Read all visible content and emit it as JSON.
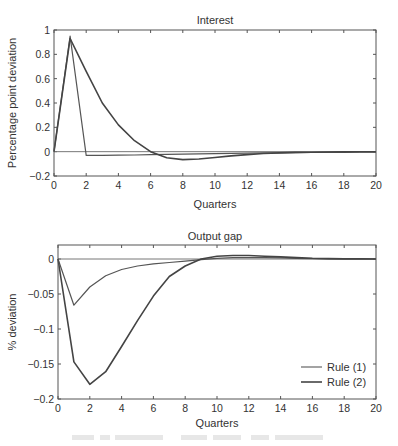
{
  "chart_data": [
    {
      "type": "line",
      "title": "Interest",
      "xlabel": "Quarters",
      "ylabel": "Percentage point deviation",
      "xlim": [
        0,
        20
      ],
      "ylim": [
        -0.2,
        1
      ],
      "xticks": [
        0,
        2,
        4,
        6,
        8,
        10,
        12,
        14,
        16,
        18,
        20
      ],
      "yticks": [
        -0.2,
        0,
        0.2,
        0.4,
        0.6,
        0.8,
        1
      ],
      "ytick_labels": [
        "−0.2",
        "0",
        "0.2",
        "0.4",
        "0.6",
        "0.8",
        "1"
      ],
      "grid": false,
      "zero_line": true,
      "x": [
        0,
        1,
        2,
        3,
        4,
        5,
        6,
        7,
        8,
        9,
        10,
        11,
        12,
        13,
        14,
        15,
        16,
        17,
        18,
        19,
        20
      ],
      "series": [
        {
          "name": "Rule (1)",
          "color": "#555555",
          "values": [
            0,
            0.95,
            -0.03,
            -0.03,
            -0.028,
            -0.027,
            -0.025,
            -0.022,
            -0.02,
            -0.018,
            -0.016,
            -0.014,
            -0.012,
            -0.01,
            -0.009,
            -0.008,
            -0.007,
            -0.006,
            -0.005,
            -0.004,
            -0.004
          ]
        },
        {
          "name": "Rule (2)",
          "color": "#444444",
          "values": [
            0,
            0.93,
            0.66,
            0.4,
            0.22,
            0.09,
            0.0,
            -0.05,
            -0.065,
            -0.06,
            -0.048,
            -0.035,
            -0.024,
            -0.015,
            -0.01,
            -0.006,
            -0.004,
            -0.003,
            -0.002,
            -0.001,
            0
          ]
        }
      ]
    },
    {
      "type": "line",
      "title": "Output gap",
      "xlabel": "Quarters",
      "ylabel": "% deviation",
      "xlim": [
        0,
        20
      ],
      "ylim": [
        -0.2,
        0.01
      ],
      "xticks": [
        0,
        2,
        4,
        6,
        8,
        10,
        12,
        14,
        16,
        18,
        20
      ],
      "yticks": [
        -0.2,
        -0.15,
        -0.1,
        -0.05,
        0
      ],
      "ytick_labels": [
        "−0.2",
        "−0.15",
        "−0.1",
        "−0.05",
        "0"
      ],
      "grid": false,
      "zero_line": true,
      "legend_position": "lower right",
      "x": [
        0,
        1,
        2,
        3,
        4,
        5,
        6,
        7,
        8,
        9,
        10,
        11,
        12,
        13,
        14,
        15,
        16,
        17,
        18,
        19,
        20
      ],
      "series": [
        {
          "name": "Rule (1)",
          "color": "#555555",
          "values": [
            0,
            -0.066,
            -0.04,
            -0.024,
            -0.015,
            -0.01,
            -0.007,
            -0.005,
            -0.003,
            -0.001,
            0.001,
            0.002,
            0.002,
            0.002,
            0.0015,
            0.001,
            0.0005,
            0.0003,
            0.0002,
            0.0001,
            0
          ]
        },
        {
          "name": "Rule (2)",
          "color": "#444444",
          "values": [
            0,
            -0.147,
            -0.179,
            -0.161,
            -0.125,
            -0.088,
            -0.053,
            -0.025,
            -0.01,
            0.0,
            0.004,
            0.005,
            0.005,
            0.004,
            0.003,
            0.002,
            0.001,
            0.0005,
            0.0002,
            0.0001,
            0
          ]
        }
      ]
    }
  ],
  "legend": {
    "items": [
      {
        "label": "Rule (1)"
      },
      {
        "label": "Rule (2)"
      }
    ]
  }
}
